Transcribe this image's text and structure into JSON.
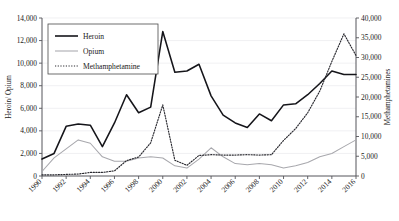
{
  "chart_data": {
    "type": "line",
    "title": "",
    "xlabel": "",
    "ylabel": "Heroin/ Opium",
    "y2label": "Methamphetamines",
    "grid": true,
    "legend_position": "top-left-inside",
    "x": [
      1990,
      1991,
      1992,
      1993,
      1994,
      1995,
      1996,
      1997,
      1998,
      1999,
      2000,
      2001,
      2002,
      2003,
      2004,
      2005,
      2006,
      2007,
      2008,
      2009,
      2010,
      2011,
      2012,
      2013,
      2014,
      2015,
      2016
    ],
    "xtick_labels": [
      "1990",
      "1992",
      "1994",
      "1996",
      "1998",
      "2000",
      "2002",
      "2004",
      "2006",
      "2008",
      "2010",
      "2012",
      "2014",
      "2016"
    ],
    "xticks": [
      1990,
      1992,
      1994,
      1996,
      1998,
      2000,
      2002,
      2004,
      2006,
      2008,
      2010,
      2012,
      2014,
      2016
    ],
    "xlim": [
      1990,
      2016
    ],
    "ylim": [
      0,
      14000
    ],
    "yticks": [
      0,
      2000,
      4000,
      6000,
      8000,
      10000,
      12000,
      14000
    ],
    "ytick_labels": [
      "0",
      "2,000",
      "4,000",
      "6,000",
      "8,000",
      "10,000",
      "12,000",
      "14,000"
    ],
    "y2lim": [
      0,
      40000
    ],
    "y2ticks": [
      0,
      5000,
      10000,
      15000,
      20000,
      25000,
      30000,
      35000,
      40000
    ],
    "y2tick_labels": [
      "0",
      "5,000",
      "10,000",
      "15,000",
      "20,000",
      "25,000",
      "30,000",
      "35,000",
      "40,000"
    ],
    "series": [
      {
        "name": "Heroin",
        "axis": "left",
        "style": "solid",
        "color": "#15151a",
        "values": [
          1500,
          2000,
          4400,
          4600,
          4500,
          2600,
          4700,
          7200,
          5600,
          6100,
          12800,
          9200,
          9300,
          9900,
          7100,
          5400,
          4700,
          4300,
          5500,
          4900,
          6300,
          6400,
          7200,
          8200,
          9300,
          9000,
          9000
        ]
      },
      {
        "name": "Opium",
        "axis": "left",
        "style": "solid",
        "color": "#a8a8ad",
        "values": [
          400,
          1600,
          2400,
          3200,
          2900,
          1700,
          1300,
          1300,
          1600,
          1700,
          1600,
          900,
          700,
          1500,
          2500,
          1700,
          1100,
          1000,
          1100,
          1000,
          700,
          900,
          1200,
          1700,
          2000,
          2600,
          3200
        ]
      },
      {
        "name": "Methamphetamine",
        "axis": "right",
        "style": "dotted",
        "color": "#2a2a30",
        "values": [
          300,
          300,
          400,
          500,
          900,
          900,
          1300,
          3900,
          4800,
          8400,
          18000,
          4000,
          2700,
          5200,
          5400,
          5300,
          5300,
          5400,
          5300,
          5400,
          9000,
          12000,
          16000,
          21500,
          29000,
          36000,
          30500
        ]
      }
    ]
  },
  "legend": {
    "items": [
      {
        "label": "Heroin"
      },
      {
        "label": "Opium"
      },
      {
        "label": "Methamphetamine"
      }
    ]
  }
}
